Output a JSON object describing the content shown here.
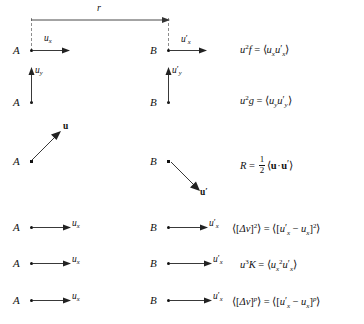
{
  "figure": {
    "separation_label": "r",
    "point_a": "A",
    "point_b": "B",
    "caption_partial": ""
  },
  "rows": [
    {
      "id": "row-longitudinal-f",
      "arrow_kind": "horizontal-right",
      "left_point": "A",
      "right_point": "B",
      "left_vector": {
        "base": "u",
        "sub": "x",
        "prime": false
      },
      "right_vector": {
        "base": "u",
        "sub": "x",
        "prime": true
      },
      "formula_plain": "u^2 f = <u_x u'_x>"
    },
    {
      "id": "row-transverse-g",
      "arrow_kind": "vertical-up",
      "left_point": "A",
      "right_point": "B",
      "left_vector": {
        "base": "u",
        "sub": "y",
        "prime": false
      },
      "right_vector": {
        "base": "u",
        "sub": "y",
        "prime": true
      },
      "formula_plain": "u^2 g = <u_y u'_y>"
    },
    {
      "id": "row-correlation-R",
      "arrow_kind": "diagonal",
      "left_point": "A",
      "right_point": "B",
      "left_vector": {
        "base": "u",
        "sub": "",
        "prime": false,
        "bold": true
      },
      "right_vector": {
        "base": "u",
        "sub": "",
        "prime": true,
        "bold": true
      },
      "formula_plain": "R = (1/2)<u.u'>"
    },
    {
      "id": "row-second-order-structure",
      "arrow_kind": "horizontal-right",
      "left_point": "A",
      "right_point": "B",
      "left_vector": {
        "base": "u",
        "sub": "x",
        "prime": false
      },
      "right_vector": {
        "base": "u",
        "sub": "x",
        "prime": true
      },
      "formula_plain": "<[Dv]^2> = <[u'_x - u_x]^2>"
    },
    {
      "id": "row-third-order-K",
      "arrow_kind": "horizontal-right",
      "left_point": "A",
      "right_point": "B",
      "left_vector": {
        "base": "u",
        "sub": "x",
        "prime": false
      },
      "right_vector": {
        "base": "u",
        "sub": "x",
        "prime": true
      },
      "formula_plain": "u^3 K = <u_x^2 u'_x>"
    },
    {
      "id": "row-pth-order-structure",
      "arrow_kind": "horizontal-right",
      "left_point": "A",
      "right_point": "B",
      "left_vector": {
        "base": "u",
        "sub": "x",
        "prime": false
      },
      "right_vector": {
        "base": "u",
        "sub": "x",
        "prime": true
      },
      "formula_plain": "<[Dv]^p> = <[u'_x - u_x]^p>"
    }
  ],
  "symbols": {
    "u": "u",
    "x": "x",
    "y": "y",
    "prime": "′",
    "delta": "Δ",
    "v": "v",
    "p": "p",
    "f": "f",
    "g": "g",
    "K": "K",
    "R": "R",
    "angle_open": "⟨",
    "angle_close": "⟩",
    "bracket_open": "[",
    "bracket_close": "]",
    "minus": "−",
    "equals": "=",
    "cdot": "·",
    "two": "2",
    "three": "3",
    "one": "1"
  }
}
